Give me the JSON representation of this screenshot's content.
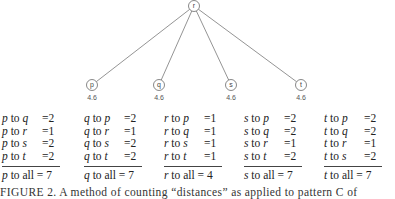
{
  "diagram": {
    "center": {
      "label": "r",
      "x": 194,
      "y": 6
    },
    "leaves": [
      {
        "label": "p",
        "value": "4.6",
        "x": 92,
        "y": 85
      },
      {
        "label": "q",
        "value": "4.6",
        "x": 159,
        "y": 85
      },
      {
        "label": "s",
        "value": "4.6",
        "x": 231,
        "y": 85
      },
      {
        "label": "t",
        "value": "4.6",
        "x": 301,
        "y": 85
      }
    ]
  },
  "tables": [
    {
      "from": "p",
      "rows": [
        {
          "to": "q",
          "value": "=2"
        },
        {
          "to": "r",
          "value": "=1"
        },
        {
          "to": "s",
          "value": "=2"
        },
        {
          "to": "t",
          "value": "=2"
        }
      ],
      "total_label": "to all",
      "total": "= 7"
    },
    {
      "from": "q",
      "rows": [
        {
          "to": "p",
          "value": "=2"
        },
        {
          "to": "r",
          "value": "=1"
        },
        {
          "to": "s",
          "value": "=2"
        },
        {
          "to": "t",
          "value": "=2"
        }
      ],
      "total_label": "to all",
      "total": "= 7"
    },
    {
      "from": "r",
      "rows": [
        {
          "to": "p",
          "value": "=1"
        },
        {
          "to": "q",
          "value": "=1"
        },
        {
          "to": "s",
          "value": "=1"
        },
        {
          "to": "t",
          "value": "=1"
        }
      ],
      "total_label": "to all",
      "total": "= 4"
    },
    {
      "from": "s",
      "rows": [
        {
          "to": "p",
          "value": "=2"
        },
        {
          "to": "q",
          "value": "=2"
        },
        {
          "to": "r",
          "value": "=1"
        },
        {
          "to": "t",
          "value": "=2"
        }
      ],
      "total_label": "to all",
      "total": "= 7"
    },
    {
      "from": "t",
      "rows": [
        {
          "to": "p",
          "value": "=2"
        },
        {
          "to": "q",
          "value": "=2"
        },
        {
          "to": "r",
          "value": "=1"
        },
        {
          "to": "s",
          "value": "=2"
        }
      ],
      "total_label": "to all",
      "total": "= 7"
    }
  ],
  "to_word": "to",
  "caption": "FIGURE 2. A method of counting “distances” as applied to pattern C of"
}
